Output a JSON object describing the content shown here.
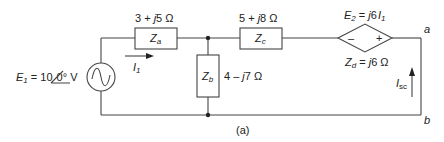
{
  "figure": {
    "caption": "(a)",
    "source": {
      "name": "E",
      "sub": "1",
      "value": " = 10",
      "angle": "0°",
      "unit": " V"
    },
    "current_i1": {
      "name": "I",
      "sub": "1"
    },
    "impedances": {
      "za": {
        "name": "Z",
        "sub": "a",
        "value_pre": "3 + ",
        "value_j": "j",
        "value_post": "5  Ω"
      },
      "zb": {
        "name": "Z",
        "sub": "b",
        "value_pre": "4 – ",
        "value_j": "j",
        "value_post": "7  Ω"
      },
      "zc": {
        "name": "Z",
        "sub": "c",
        "value_pre": "5 + ",
        "value_j": "j",
        "value_post": "8  Ω"
      },
      "zd": {
        "name": "Z",
        "sub": "d",
        "value_pre": " = ",
        "value_j": "j",
        "value_post": "6 Ω"
      }
    },
    "dependent_source": {
      "name": "E",
      "sub": "2",
      "eq": " = ",
      "j": "j",
      "coef": "6",
      "ctrl": "I",
      "ctrl_sub": "1",
      "minus": "–",
      "plus": "+"
    },
    "short_circuit_current": {
      "name": "I",
      "sub": "sc"
    },
    "terminals": {
      "a": "a",
      "b": "b"
    }
  },
  "colors": {
    "wire": "#444444",
    "text": "#222222",
    "background": "#ffffff"
  }
}
